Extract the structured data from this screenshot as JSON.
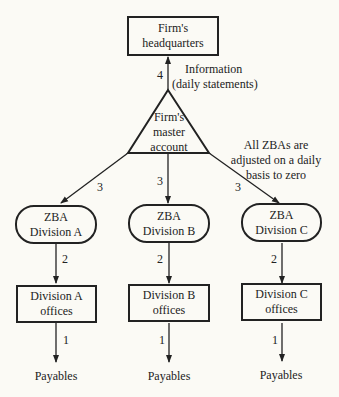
{
  "headquarters": {
    "line1": "Firm's",
    "line2": "headquarters"
  },
  "info_edge": {
    "number": "4",
    "line1": "Information",
    "line2": "(daily statements)"
  },
  "master_account": {
    "line1": "Firm's",
    "line2": "master",
    "line3": "account"
  },
  "note": {
    "line1": "All ZBAs are",
    "line2": "adjusted on a daily",
    "line3": "basis to zero"
  },
  "divisions": [
    {
      "zba_line1": "ZBA",
      "zba_line2": "Division A",
      "office_line1": "Division A",
      "office_line2": "offices",
      "edge_master": "3",
      "edge_zba": "2",
      "edge_office": "1",
      "payables": "Payables"
    },
    {
      "zba_line1": "ZBA",
      "zba_line2": "Division B",
      "office_line1": "Division B",
      "office_line2": "offices",
      "edge_master": "3",
      "edge_zba": "2",
      "edge_office": "1",
      "payables": "Payables"
    },
    {
      "zba_line1": "ZBA",
      "zba_line2": "Division C",
      "office_line1": "Division C",
      "office_line2": "offices",
      "edge_master": "3",
      "edge_zba": "2",
      "edge_office": "1",
      "payables": "Payables"
    }
  ]
}
